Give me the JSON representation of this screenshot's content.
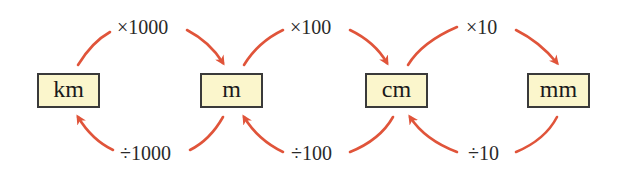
{
  "colors": {
    "arrow": "#e0543a",
    "box_fill": "#fbf6cc",
    "box_border": "#3a3a3a",
    "text": "#1a1a1a"
  },
  "units": [
    {
      "id": "km",
      "label": "km"
    },
    {
      "id": "m",
      "label": "m"
    },
    {
      "id": "cm",
      "label": "cm"
    },
    {
      "id": "mm",
      "label": "mm"
    }
  ],
  "conversions": {
    "multiply": [
      {
        "from": "km",
        "to": "m",
        "label": "×1000"
      },
      {
        "from": "m",
        "to": "cm",
        "label": "×100"
      },
      {
        "from": "cm",
        "to": "mm",
        "label": "×10"
      }
    ],
    "divide": [
      {
        "from": "m",
        "to": "km",
        "label": "÷1000"
      },
      {
        "from": "cm",
        "to": "m",
        "label": "÷100"
      },
      {
        "from": "mm",
        "to": "cm",
        "label": "÷10"
      }
    ]
  }
}
